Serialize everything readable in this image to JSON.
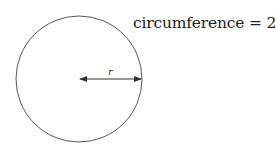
{
  "diagram": {
    "title_label": "circumference",
    "equals": "=",
    "formula_coefficient": "2",
    "formula_pi": "π",
    "formula_var": "r",
    "radius_label": "r",
    "stroke_color": "#333333",
    "circle": {
      "cx": 79,
      "cy": 79,
      "r": 63
    }
  }
}
